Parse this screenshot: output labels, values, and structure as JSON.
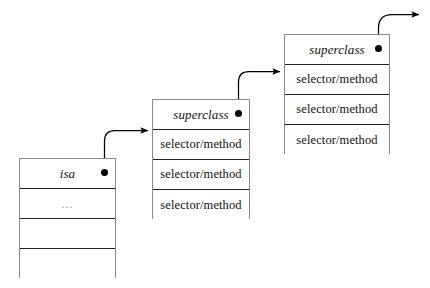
{
  "diagram": {
    "background_color": "#ffffff",
    "line_color": "#000000",
    "box_border_color": "#8a8a8a",
    "row_divider_color": "#222222"
  },
  "boxes": [
    {
      "id": "instance",
      "name": "instance-object-box",
      "rows": [
        {
          "label": "isa",
          "style": "italic",
          "has_pointer_dot": true
        },
        {
          "label": "...",
          "style": "ellipsis",
          "has_pointer_dot": false
        },
        {
          "label": "",
          "style": "empty",
          "has_pointer_dot": false
        },
        {
          "label": "",
          "style": "empty",
          "has_pointer_dot": false
        }
      ]
    },
    {
      "id": "middle",
      "name": "class-object-box-middle",
      "rows": [
        {
          "label": "superclass",
          "style": "italic",
          "has_pointer_dot": true
        },
        {
          "label": "selector/method",
          "style": "plain",
          "has_pointer_dot": false
        },
        {
          "label": "selector/method",
          "style": "plain",
          "has_pointer_dot": false
        },
        {
          "label": "selector/method",
          "style": "plain",
          "has_pointer_dot": false
        }
      ]
    },
    {
      "id": "right",
      "name": "class-object-box-right",
      "rows": [
        {
          "label": "superclass",
          "style": "italic",
          "has_pointer_dot": true
        },
        {
          "label": "selector/method",
          "style": "plain",
          "has_pointer_dot": false
        },
        {
          "label": "selector/method",
          "style": "plain",
          "has_pointer_dot": false
        },
        {
          "label": "selector/method",
          "style": "plain",
          "has_pointer_dot": false
        }
      ]
    }
  ],
  "arrows": [
    {
      "name": "isa-to-middle-class-arrow",
      "from": "instance.isa",
      "to": "middle-box"
    },
    {
      "name": "superclass-to-right-class-arrow",
      "from": "middle.superclass",
      "to": "right-box"
    },
    {
      "name": "superclass-to-next-arrow",
      "from": "right.superclass",
      "to": "offscreen"
    }
  ]
}
